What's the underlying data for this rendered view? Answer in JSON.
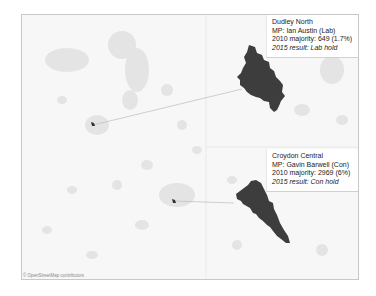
{
  "map": {
    "attribution": "© OpenStreetMap contributors",
    "colors": {
      "background": "#f7f7f7",
      "urban": "#e2e2e2",
      "constituency_fill": "#3d3d3d",
      "connector": "#bbbbbb",
      "frame_border": "#c8c8c8"
    }
  },
  "callouts": [
    {
      "constituency": "Dudley North",
      "mp": "MP: Ian Austin (Lab)",
      "majority": "2010 majority: 649 (1.7%)",
      "result": "2015 result: Lab hold"
    },
    {
      "constituency": "Croydon Central",
      "mp": "MP: Gavin Barwell (Con)",
      "majority": "2010 majority: 2969 (6%)",
      "result": "2015 result: Con hold"
    }
  ]
}
